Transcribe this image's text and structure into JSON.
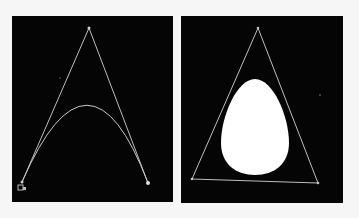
{
  "colors": {
    "background": "#f6f6f6",
    "panel": "#050505",
    "stroke": "#c8c8c8",
    "fill": "#ffffff"
  },
  "left_panel": {
    "label": "",
    "control_polygon": [
      [
        77,
        12
      ],
      [
        10,
        166
      ],
      [
        136,
        167
      ]
    ],
    "curve": {
      "start": [
        10,
        166
      ],
      "control": [
        77,
        12
      ],
      "end": [
        136,
        167
      ]
    },
    "stray_point": [
      48,
      62
    ]
  },
  "right_panel": {
    "triangle": [
      [
        77,
        12
      ],
      [
        11,
        163
      ],
      [
        137,
        167
      ]
    ],
    "egg": {
      "cx": 74,
      "top": 63,
      "bottom": 159,
      "left": 40,
      "right": 108
    },
    "stray_point": [
      139,
      79
    ]
  }
}
